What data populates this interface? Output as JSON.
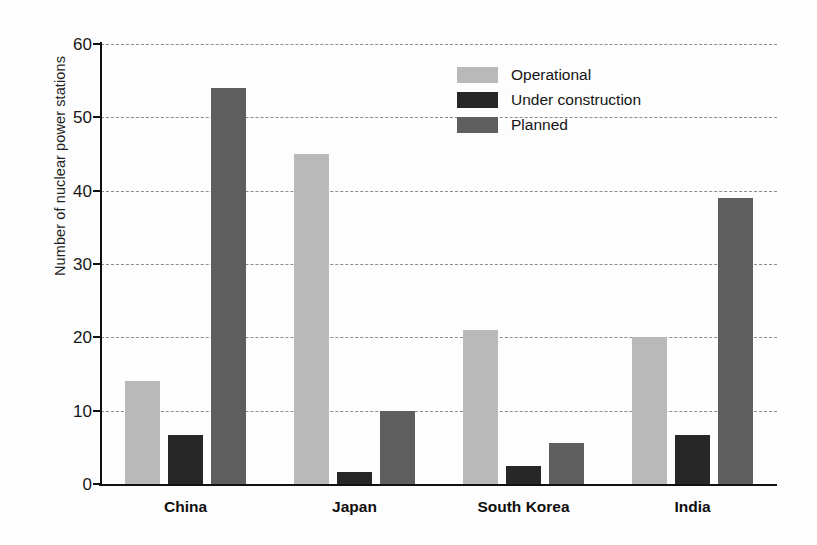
{
  "chart_data": {
    "type": "bar",
    "title": "",
    "xlabel": "",
    "ylabel": "Number of nuclear power stations",
    "ylim": [
      0,
      60
    ],
    "ytick_step": 10,
    "yticks": [
      0,
      10,
      20,
      30,
      40,
      50,
      60
    ],
    "ytick_labels": [
      "0",
      "10",
      "20",
      "30",
      "40",
      "50",
      "60"
    ],
    "grid": true,
    "grid_style": "dashed-horizontal",
    "legend_position": "upper-center-right",
    "categories": [
      "China",
      "Japan",
      "South Korea",
      "India"
    ],
    "series": [
      {
        "name": "Operational",
        "color": "#b9b9b9",
        "values": [
          14,
          45,
          21,
          20
        ]
      },
      {
        "name": "Under construction",
        "color": "#272727",
        "values": [
          6.7,
          1.7,
          2.5,
          6.7
        ]
      },
      {
        "name": "Planned",
        "color": "#5e5e5e",
        "values": [
          54,
          10,
          5.6,
          39
        ]
      }
    ]
  },
  "axis": {
    "y_title": "Number of nuclear power stations"
  },
  "colors": {
    "operational": "#b9b9b9",
    "under_construction": "#272727",
    "planned": "#5e5e5e",
    "axis": "#101010",
    "gridline": "#8d8d8d",
    "background": "#fdfdfd"
  }
}
